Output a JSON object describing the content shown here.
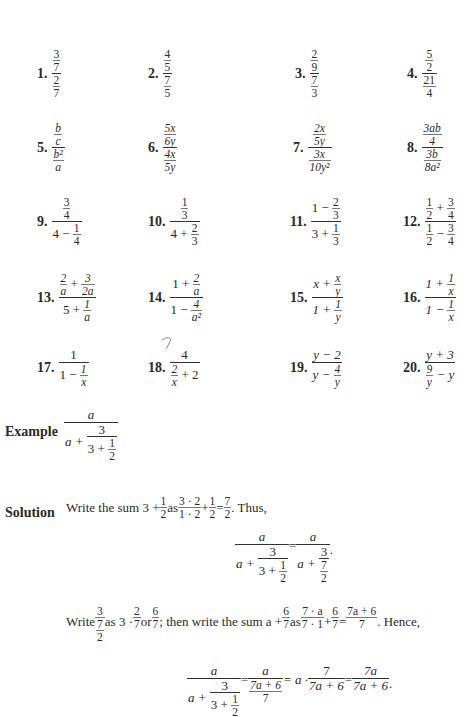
{
  "problems": [
    {
      "n": "1.",
      "top": "3",
      "top_d": "7",
      "bot": "2",
      "bot_d": "7"
    },
    {
      "n": "2.",
      "top": "4",
      "top_d": "5",
      "bot": "7",
      "bot_d": "5"
    },
    {
      "n": "3.",
      "top": "2",
      "top_d": "9",
      "bot": "7",
      "bot_d": "3"
    },
    {
      "n": "4.",
      "top": "5",
      "top_d": "2",
      "bot": "21",
      "bot_d": "4"
    },
    {
      "n": "5.",
      "top": "b",
      "top_d": "c",
      "bot": "b²",
      "bot_d": "a"
    },
    {
      "n": "6.",
      "top": "5x",
      "top_d": "6y",
      "bot": "4x",
      "bot_d": "5y"
    },
    {
      "n": "7.",
      "top": "2x",
      "top_d": "5y",
      "bot": "3x",
      "bot_d": "10y²"
    },
    {
      "n": "8.",
      "top": "3ab",
      "top_d": "4",
      "bot": "3b",
      "bot_d": "8a²"
    },
    {
      "n": "9.",
      "num_n": "3",
      "num_d": "4",
      "den_pre": "4 − ",
      "den_n": "1",
      "den_d": "4"
    },
    {
      "n": "10.",
      "num_n": "1",
      "num_d": "3",
      "den_pre": "4 + ",
      "den_n": "2",
      "den_d": "3"
    },
    {
      "n": "11.",
      "num_pre": "1 − ",
      "num_n": "2",
      "num_d": "3",
      "den_pre": "3 + ",
      "den_n": "1",
      "den_d": "3"
    },
    {
      "n": "12.",
      "a_n": "1",
      "a_d": "2",
      "op1": " + ",
      "b_n": "3",
      "b_d": "4",
      "c_n": "1",
      "c_d": "2",
      "op2": " − ",
      "d_n": "3",
      "d_d": "4"
    },
    {
      "n": "13.",
      "a_n": "2",
      "a_d": "a",
      "op1": " + ",
      "b_n": "3",
      "b_d": "2a",
      "den_pre": "5 + ",
      "den_n": "1",
      "den_d": "a"
    },
    {
      "n": "14.",
      "num_pre": "1 + ",
      "num_n": "2",
      "num_d": "a",
      "den_pre": "1 − ",
      "den_n": "4",
      "den_d": "a²"
    },
    {
      "n": "15.",
      "num_pre": "x + ",
      "num_n": "x",
      "num_d": "y",
      "den_pre": "1 + ",
      "den_n": "1",
      "den_d": "y"
    },
    {
      "n": "16.",
      "num_pre": "1 + ",
      "num_n": "1",
      "num_d": "x",
      "den_pre": "1 − ",
      "den_n": "1",
      "den_d": "x"
    },
    {
      "n": "17.",
      "num": "1",
      "den_pre": "1 − ",
      "den_n": "1",
      "den_d": "x"
    },
    {
      "n": "18.",
      "num": "4",
      "den_n": "2",
      "den_d": "x",
      "den_post": " + 2"
    },
    {
      "n": "19.",
      "num": "y − 2",
      "den_pre": "y − ",
      "den_n": "4",
      "den_d": "y"
    },
    {
      "n": "20.",
      "num": "y + 3",
      "den_n": "9",
      "den_d": "y",
      "den_post": " − y"
    }
  ],
  "example": {
    "label": "Example",
    "num": "a",
    "den_pre": "a + ",
    "inner_num": "3",
    "inner_den_pre": "3 + ",
    "inner_den_n": "1",
    "inner_den_d": "2"
  },
  "solution": {
    "label": "Solution",
    "line1": {
      "t1": "Write the sum 3 + ",
      "f1n": "1",
      "f1d": "2",
      "t2": " as ",
      "f2n": "3 · 2",
      "f2d": "1 · 2",
      "t3": " + ",
      "f3n": "1",
      "f3d": "2",
      "t4": " = ",
      "f4n": "7",
      "f4d": "2",
      "t5": ". Thus,"
    },
    "eq1": {
      "lhs_num": "a",
      "lhs_den_pre": "a + ",
      "lhs_in_num": "3",
      "lhs_in_den_pre": "3 + ",
      "lhs_in_den_n": "1",
      "lhs_in_den_d": "2",
      "eq": " = ",
      "rhs_num": "a",
      "rhs_den_pre": "a + ",
      "rhs_in_num": "3",
      "rhs_in_den_n": "7",
      "rhs_in_den_d": "2",
      "end": "."
    },
    "line2": {
      "t1": "Write ",
      "f1n": "3",
      "f1dn": "7",
      "f1dd": "2",
      "t2": " as 3 · ",
      "f2n": "2",
      "f2d": "7",
      "t3": " or ",
      "f3n": "6",
      "f3d": "7",
      "t4": "; then write the sum a + ",
      "f4n": "6",
      "f4d": "7",
      "t5": " as ",
      "f5n": "7 · a",
      "f5d": "7 · 1",
      "t6": " + ",
      "f6n": "6",
      "f6d": "7",
      "t7": " = ",
      "f7n": "7a + 6",
      "f7d": "7",
      "t8": ". Hence,"
    },
    "eq2": {
      "lhs_num": "a",
      "lhs_den_pre": "a + ",
      "lhs_in_num": "3",
      "lhs_in_den_pre": "3 + ",
      "lhs_in_den_n": "1",
      "lhs_in_den_d": "2",
      "eq1": " = ",
      "f1n": "a",
      "f1nn": "7a + 6",
      "f1nd": "7",
      "eq2": " = a · ",
      "f2n": "7",
      "f2d": "7a + 6",
      "eq3": " = ",
      "f3n": "7a",
      "f3d": "7a + 6",
      "end": "."
    }
  }
}
